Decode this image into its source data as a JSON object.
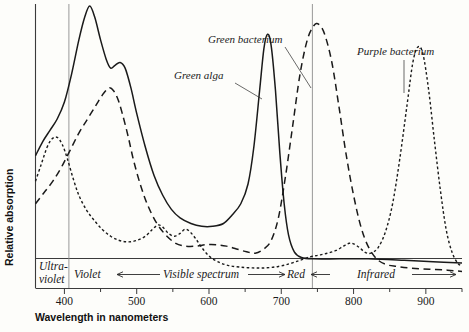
{
  "chart_data": {
    "type": "line",
    "title": "",
    "xlabel": "Wavelength in nanometers",
    "ylabel": "Relative absorption",
    "xlim": [
      360,
      950
    ],
    "ylim": [
      0,
      1
    ],
    "grid": false,
    "legend_position": "inline-annotations",
    "x_ticks": [
      400,
      500,
      600,
      700,
      800,
      900
    ],
    "x_tick_labels": [
      "400",
      "500",
      "600",
      "700",
      "800",
      "900"
    ],
    "x_minor_ticks": [
      450,
      550,
      650,
      750,
      850,
      950
    ],
    "y_ticks": [],
    "y_tick_labels": [],
    "vertical_gridlines": [
      400,
      750
    ],
    "series": [
      {
        "name": "Green alga",
        "style": "solid",
        "color": "#1a1a1a",
        "points": [
          [
            360,
            0.47
          ],
          [
            370,
            0.52
          ],
          [
            380,
            0.56
          ],
          [
            390,
            0.6
          ],
          [
            400,
            0.66
          ],
          [
            410,
            0.76
          ],
          [
            420,
            0.88
          ],
          [
            428,
            0.96
          ],
          [
            435,
            1.0
          ],
          [
            442,
            0.96
          ],
          [
            450,
            0.88
          ],
          [
            458,
            0.81
          ],
          [
            464,
            0.78
          ],
          [
            470,
            0.79
          ],
          [
            477,
            0.8
          ],
          [
            484,
            0.78
          ],
          [
            492,
            0.71
          ],
          [
            500,
            0.62
          ],
          [
            512,
            0.5
          ],
          [
            524,
            0.4
          ],
          [
            536,
            0.33
          ],
          [
            548,
            0.28
          ],
          [
            560,
            0.25
          ],
          [
            575,
            0.23
          ],
          [
            590,
            0.22
          ],
          [
            605,
            0.22
          ],
          [
            620,
            0.23
          ],
          [
            632,
            0.26
          ],
          [
            644,
            0.3
          ],
          [
            654,
            0.37
          ],
          [
            662,
            0.5
          ],
          [
            670,
            0.7
          ],
          [
            676,
            0.85
          ],
          [
            681,
            0.9
          ],
          [
            686,
            0.86
          ],
          [
            692,
            0.7
          ],
          [
            698,
            0.48
          ],
          [
            704,
            0.3
          ],
          [
            710,
            0.19
          ],
          [
            718,
            0.13
          ],
          [
            728,
            0.11
          ],
          [
            745,
            0.105
          ],
          [
            780,
            0.105
          ],
          [
            820,
            0.105
          ],
          [
            870,
            0.1
          ],
          [
            910,
            0.095
          ],
          [
            950,
            0.09
          ]
        ]
      },
      {
        "name": "Green bacterium",
        "style": "long-dash",
        "color": "#1a1a1a",
        "points": [
          [
            360,
            0.3
          ],
          [
            372,
            0.34
          ],
          [
            384,
            0.38
          ],
          [
            396,
            0.43
          ],
          [
            408,
            0.49
          ],
          [
            420,
            0.55
          ],
          [
            432,
            0.6
          ],
          [
            444,
            0.65
          ],
          [
            454,
            0.69
          ],
          [
            462,
            0.71
          ],
          [
            468,
            0.7
          ],
          [
            474,
            0.67
          ],
          [
            480,
            0.62
          ],
          [
            488,
            0.54
          ],
          [
            496,
            0.45
          ],
          [
            506,
            0.36
          ],
          [
            516,
            0.29
          ],
          [
            528,
            0.23
          ],
          [
            540,
            0.19
          ],
          [
            554,
            0.16
          ],
          [
            568,
            0.15
          ],
          [
            582,
            0.15
          ],
          [
            596,
            0.155
          ],
          [
            610,
            0.155
          ],
          [
            624,
            0.15
          ],
          [
            638,
            0.14
          ],
          [
            652,
            0.13
          ],
          [
            664,
            0.125
          ],
          [
            676,
            0.14
          ],
          [
            686,
            0.17
          ],
          [
            696,
            0.25
          ],
          [
            706,
            0.4
          ],
          [
            716,
            0.58
          ],
          [
            726,
            0.76
          ],
          [
            736,
            0.88
          ],
          [
            745,
            0.93
          ],
          [
            752,
            0.935
          ],
          [
            760,
            0.9
          ],
          [
            770,
            0.8
          ],
          [
            780,
            0.64
          ],
          [
            790,
            0.47
          ],
          [
            800,
            0.33
          ],
          [
            810,
            0.22
          ],
          [
            820,
            0.15
          ],
          [
            832,
            0.105
          ],
          [
            845,
            0.085
          ],
          [
            860,
            0.078
          ],
          [
            880,
            0.072
          ],
          [
            905,
            0.068
          ],
          [
            930,
            0.065
          ],
          [
            950,
            0.06
          ]
        ]
      },
      {
        "name": "Purple bacterium",
        "style": "short-dash",
        "color": "#1a1a1a",
        "points": [
          [
            360,
            0.38
          ],
          [
            368,
            0.44
          ],
          [
            376,
            0.5
          ],
          [
            383,
            0.53
          ],
          [
            390,
            0.535
          ],
          [
            397,
            0.51
          ],
          [
            404,
            0.46
          ],
          [
            412,
            0.39
          ],
          [
            420,
            0.33
          ],
          [
            430,
            0.28
          ],
          [
            440,
            0.245
          ],
          [
            452,
            0.21
          ],
          [
            464,
            0.185
          ],
          [
            476,
            0.17
          ],
          [
            488,
            0.165
          ],
          [
            500,
            0.17
          ],
          [
            512,
            0.185
          ],
          [
            522,
            0.21
          ],
          [
            530,
            0.225
          ],
          [
            537,
            0.215
          ],
          [
            544,
            0.195
          ],
          [
            552,
            0.185
          ],
          [
            560,
            0.195
          ],
          [
            567,
            0.21
          ],
          [
            574,
            0.2
          ],
          [
            582,
            0.175
          ],
          [
            590,
            0.145
          ],
          [
            600,
            0.115
          ],
          [
            612,
            0.095
          ],
          [
            626,
            0.082
          ],
          [
            642,
            0.076
          ],
          [
            660,
            0.073
          ],
          [
            678,
            0.073
          ],
          [
            696,
            0.078
          ],
          [
            712,
            0.088
          ],
          [
            726,
            0.1
          ],
          [
            740,
            0.112
          ],
          [
            752,
            0.118
          ],
          [
            764,
            0.125
          ],
          [
            776,
            0.135
          ],
          [
            786,
            0.15
          ],
          [
            794,
            0.16
          ],
          [
            800,
            0.158
          ],
          [
            808,
            0.145
          ],
          [
            816,
            0.128
          ],
          [
            824,
            0.125
          ],
          [
            834,
            0.145
          ],
          [
            844,
            0.2
          ],
          [
            854,
            0.3
          ],
          [
            864,
            0.46
          ],
          [
            874,
            0.65
          ],
          [
            882,
            0.8
          ],
          [
            889,
            0.855
          ],
          [
            896,
            0.83
          ],
          [
            904,
            0.7
          ],
          [
            912,
            0.52
          ],
          [
            920,
            0.35
          ],
          [
            928,
            0.21
          ],
          [
            936,
            0.13
          ],
          [
            944,
            0.09
          ],
          [
            950,
            0.08
          ]
        ]
      }
    ],
    "annotations": [
      {
        "text": "Green bacterium",
        "label_x": 208,
        "label_y": 43,
        "leader": [
          [
            285,
            47
          ],
          [
            311,
            88
          ]
        ],
        "target_series": "Green bacterium"
      },
      {
        "text": "Green alga",
        "label_x": 174,
        "label_y": 79,
        "leader": [
          [
            235,
            83
          ],
          [
            262,
            99
          ]
        ],
        "target_series": "Green alga"
      },
      {
        "text": "Purple bacterium",
        "label_x": 357,
        "label_y": 55,
        "leader": [
          [
            404,
            60
          ],
          [
            404,
            93
          ]
        ],
        "target_series": "Purple bacterium"
      }
    ],
    "region_bands": [
      {
        "name": "ultra-violet",
        "label": "Ultra-\nviolet",
        "line1": "Ultra-",
        "line2": "violet",
        "from": 360,
        "to": 400,
        "arrows": "none"
      },
      {
        "name": "violet",
        "label": "Violet",
        "from": 400,
        "to": 430,
        "arrows": "none"
      },
      {
        "name": "visible-spectrum",
        "label": "Visible spectrum",
        "from": 430,
        "to": 735,
        "arrows": "both"
      },
      {
        "name": "red",
        "label": "Red",
        "from": 700,
        "to": 750,
        "arrows": "left"
      },
      {
        "name": "infrared",
        "label": "Infrared",
        "from": 750,
        "to": 950,
        "arrows": "both"
      }
    ]
  },
  "axis": {
    "x_title": "Wavelength in nanometers",
    "y_title": "Relative absorption"
  },
  "labels": {
    "green_bacterium": "Green bacterium",
    "green_alga": "Green alga",
    "purple_bacterium": "Purple bacterium",
    "ultraviolet_line1": "Ultra-",
    "ultraviolet_line2": "violet",
    "violet": "Violet",
    "visible_spectrum": "Visible spectrum",
    "red": "Red",
    "infrared": "Infrared",
    "tick_400": "400",
    "tick_500": "500",
    "tick_600": "600",
    "tick_700": "700",
    "tick_800": "800",
    "tick_900": "900"
  },
  "colors": {
    "ink": "#1a1a1a",
    "background": "#fdfdfa",
    "gridline": "#8d8d8d",
    "frame": "#3b3b3b"
  }
}
